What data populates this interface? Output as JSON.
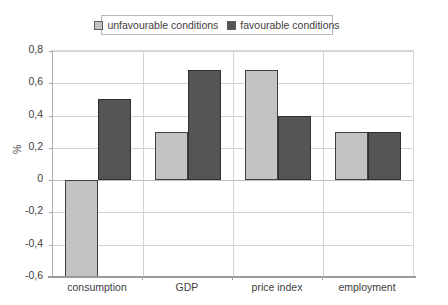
{
  "legend": {
    "position": "top-center",
    "entries": [
      {
        "label": "unfavourable conditions",
        "swatch": "light-gray-square-icon",
        "color": "#c3c3c3"
      },
      {
        "label": "favourable conditions",
        "swatch": "dark-gray-square-icon",
        "color": "#555555"
      }
    ]
  },
  "axes": {
    "ylabel": "%",
    "yticks": [
      "0,8",
      "0,6",
      "0,4",
      "0,2",
      "0",
      "-0,2",
      "-0,4",
      "-0,6"
    ]
  },
  "chart_data": {
    "type": "bar",
    "title": "",
    "xlabel": "",
    "ylabel": "%",
    "categories": [
      "consumption",
      "GDP",
      "price index",
      "employment"
    ],
    "series": [
      {
        "name": "unfavourable conditions",
        "color": "#c3c3c3",
        "values": [
          -0.6,
          0.3,
          0.68,
          0.3
        ]
      },
      {
        "name": "favourable conditions",
        "color": "#555555",
        "values": [
          0.5,
          0.68,
          0.4,
          0.3
        ]
      }
    ],
    "ylim": [
      -0.6,
      0.8
    ],
    "ytick_values": [
      0.8,
      0.6,
      0.4,
      0.2,
      0,
      -0.2,
      -0.4,
      -0.6
    ],
    "ytick_labels": [
      "0,8",
      "0,6",
      "0,4",
      "0,2",
      "0",
      "-0,2",
      "-0,4",
      "-0,6"
    ],
    "grid": true,
    "legend": "top-center",
    "decimal_separator": ","
  }
}
